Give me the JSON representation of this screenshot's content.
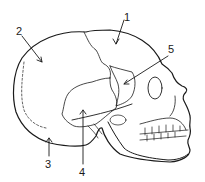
{
  "diagram": {
    "labels": [
      {
        "id": "1",
        "text": "1",
        "x": 124,
        "y": 13
      },
      {
        "id": "2",
        "text": "2",
        "x": 17,
        "y": 27
      },
      {
        "id": "3",
        "text": "3",
        "x": 46,
        "y": 160
      },
      {
        "id": "4",
        "text": "4",
        "x": 80,
        "y": 168
      },
      {
        "id": "5",
        "text": "5",
        "x": 169,
        "y": 45
      }
    ],
    "line_color": "#1a1a1a",
    "background": "#ffffff"
  }
}
